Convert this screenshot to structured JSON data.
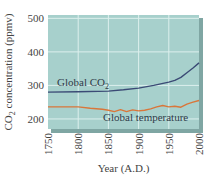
{
  "chart_data": {
    "type": "line",
    "title": "",
    "xlabel": "Year (A.D.)",
    "ylabel": "CO2 concentration (ppmv)",
    "ylabel_parts": {
      "pre": "CO",
      "sub": "2",
      "post": " concentration (ppmv)"
    },
    "xlim": [
      1750,
      2000
    ],
    "ylim": [
      170,
      510
    ],
    "x_ticks": [
      1750,
      1800,
      1850,
      1900,
      1950,
      2000
    ],
    "y_ticks": [
      200,
      300,
      400,
      500
    ],
    "grid": true,
    "legend": "inline labels",
    "series": [
      {
        "name": "Global CO2",
        "label_pre": "Global CO",
        "label_sub": "2",
        "color": "#3b4a75",
        "x": [
          1750,
          1800,
          1850,
          1875,
          1900,
          1925,
          1950,
          1960,
          1970,
          1980,
          1990,
          2000
        ],
        "values": [
          280,
          281,
          283,
          287,
          292,
          300,
          310,
          315,
          324,
          338,
          352,
          367
        ]
      },
      {
        "name": "Global temperature",
        "label": "Global temperature",
        "color": "#d9763a",
        "note": "relative scale, plotted visually near the 200-250 band",
        "x": [
          1750,
          1790,
          1800,
          1820,
          1840,
          1850,
          1860,
          1870,
          1880,
          1890,
          1900,
          1910,
          1920,
          1930,
          1940,
          1950,
          1960,
          1970,
          1980,
          1990,
          2000
        ],
        "values": [
          236,
          236,
          236,
          232,
          229,
          226,
          222,
          228,
          222,
          227,
          224,
          226,
          230,
          236,
          240,
          236,
          238,
          235,
          244,
          250,
          255
        ]
      }
    ]
  },
  "colors": {
    "plot_bg": "#a7d0cc",
    "grid": "#dcefed",
    "bevel": "#7fa6a3"
  }
}
